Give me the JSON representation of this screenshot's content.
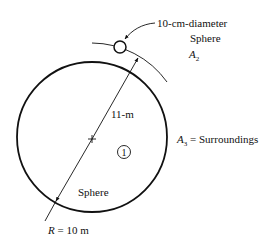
{
  "diagram": {
    "type": "radiation-geometry",
    "labels": {
      "small_sphere_desc_1": "10-cm-diameter",
      "small_sphere_desc_2": "Sphere",
      "small_sphere_area_sym": "A",
      "small_sphere_area_sub": "2",
      "distance": "11-m",
      "region_number": "1",
      "big_sphere_name": "Sphere",
      "radius_sym": "R",
      "radius_value": " = 10 m",
      "surroundings_sym": "A",
      "surroundings_sub": "3",
      "surroundings_text": " = Surroundings"
    },
    "colors": {
      "stroke": "#111111",
      "background": "#ffffff"
    }
  }
}
